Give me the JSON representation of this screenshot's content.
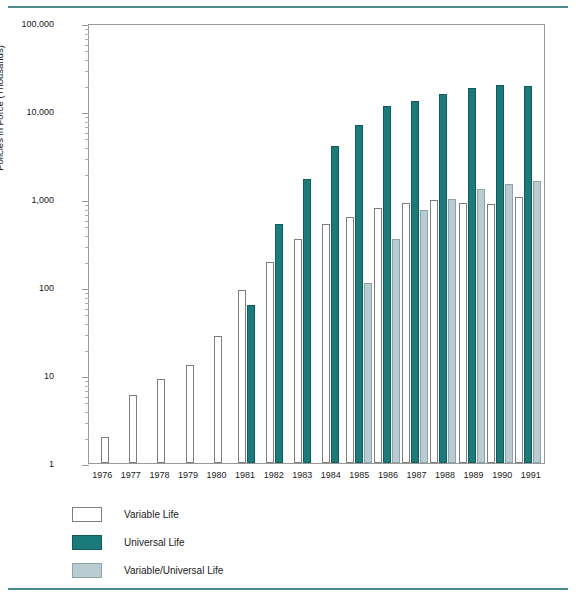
{
  "chart_data": {
    "type": "bar",
    "title": "",
    "xlabel": "",
    "ylabel": "Policies in Force (Thousands)",
    "yscale": "log",
    "ylim": [
      1,
      100000
    ],
    "ytick_labels": [
      "100,000",
      "10,000",
      "1,000",
      "100",
      "10",
      "1"
    ],
    "ytick_values": [
      100000,
      10000,
      1000,
      100,
      10,
      1
    ],
    "grid": false,
    "legend_position": "below-left",
    "categories": [
      "1976",
      "1977",
      "1978",
      "1979",
      "1980",
      "1981",
      "1982",
      "1983",
      "1984",
      "1985",
      "1986",
      "1987",
      "1988",
      "1989",
      "1990",
      "1991"
    ],
    "series": [
      {
        "name": "Variable Life",
        "color": "#ffffff",
        "values": [
          2,
          6,
          9,
          13,
          28,
          93,
          190,
          350,
          520,
          620,
          800,
          900,
          980,
          900,
          880,
          1050
        ]
      },
      {
        "name": "Universal Life",
        "color": "#1b7b7b",
        "values": [
          null,
          null,
          null,
          null,
          null,
          62,
          520,
          1700,
          4000,
          7000,
          11500,
          13000,
          15500,
          18500,
          19500,
          19000
        ]
      },
      {
        "name": "Variable/Universal Life",
        "color": "#b9ccd1",
        "values": [
          null,
          null,
          null,
          null,
          null,
          null,
          null,
          null,
          null,
          110,
          350,
          750,
          1000,
          1300,
          1500,
          1600
        ]
      }
    ]
  },
  "legend": {
    "items": [
      {
        "label": "Variable Life",
        "swatch": "vl"
      },
      {
        "label": "Universal Life",
        "swatch": "ul"
      },
      {
        "label": "Variable/Universal Life",
        "swatch": "vul"
      }
    ]
  },
  "colors": {
    "universal_life": "#1b7b7b",
    "variable_universal_life": "#b9ccd1",
    "variable_life": "#ffffff",
    "rule": "#4a8c8c",
    "axis": "#9a9a9a"
  }
}
